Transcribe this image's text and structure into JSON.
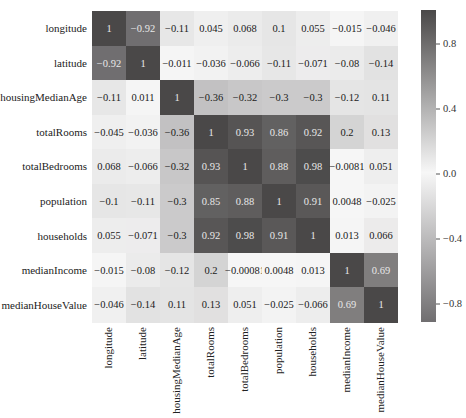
{
  "chart_data": {
    "type": "heatmap",
    "title": "",
    "xlabel": "",
    "ylabel": "",
    "labels": [
      "longitude",
      "latitude",
      "housingMedianAge",
      "totalRooms",
      "totalBedrooms",
      "population",
      "households",
      "medianIncome",
      "medianHouseValue"
    ],
    "x_tick_labels_visible": [
      "longitude",
      "latitude",
      "ingMedianAge",
      "totalRooms",
      "totalBedrooms",
      "population",
      "households",
      "medianIncome",
      "anHouseValue"
    ],
    "matrix": [
      [
        1,
        -0.92,
        -0.11,
        0.045,
        0.068,
        0.1,
        0.055,
        -0.015,
        -0.046
      ],
      [
        -0.92,
        1,
        0.011,
        -0.036,
        -0.066,
        -0.11,
        -0.071,
        -0.08,
        -0.14
      ],
      [
        -0.11,
        0.011,
        1,
        -0.36,
        -0.32,
        -0.3,
        -0.3,
        -0.12,
        0.11
      ],
      [
        0.045,
        -0.036,
        -0.36,
        1,
        0.93,
        0.86,
        0.92,
        0.2,
        0.13
      ],
      [
        0.068,
        -0.066,
        -0.32,
        0.93,
        1,
        0.88,
        0.98,
        -0.0081,
        0.051
      ],
      [
        0.1,
        -0.11,
        -0.3,
        0.86,
        0.88,
        1,
        0.91,
        0.0048,
        -0.025
      ],
      [
        0.055,
        -0.071,
        -0.3,
        0.92,
        0.98,
        0.91,
        1,
        0.013,
        0.066
      ],
      [
        -0.015,
        -0.08,
        -0.12,
        0.2,
        -0.0081,
        0.0048,
        0.013,
        1,
        0.69
      ],
      [
        -0.046,
        -0.14,
        0.11,
        0.13,
        0.051,
        -0.025,
        -0.066,
        0.69,
        1
      ]
    ],
    "annotations": [
      [
        "1",
        "−0.92",
        "−0.11",
        "0.045",
        "0.068",
        "0.1",
        "0.055",
        "−0.015",
        "−0.046"
      ],
      [
        "−0.92",
        "1",
        "−0.011",
        "−0.036",
        "−0.066",
        "−0.11",
        "−0.071",
        "−0.08",
        "−0.14"
      ],
      [
        "−0.11",
        "0.011",
        "1",
        "−0.36",
        "−0.32",
        "−0.3",
        "−0.3",
        "−0.12",
        "0.11"
      ],
      [
        "−0.045",
        "−0.036",
        "−0.36",
        "1",
        "0.93",
        "0.86",
        "0.92",
        "0.2",
        "0.13"
      ],
      [
        "0.068",
        "−0.066",
        "−0.32",
        "0.93",
        "1",
        "0.88",
        "0.98",
        "−0.0081",
        "0.051"
      ],
      [
        "−0.1",
        "−0.11",
        "−0.3",
        "0.85",
        "0.88",
        "1",
        "0.91",
        "0.0048",
        "−0.025"
      ],
      [
        "0.055",
        "−0.071",
        "−0.3",
        "0.92",
        "0.98",
        "0.91",
        "1",
        "0.013",
        "0.066"
      ],
      [
        "−0.015",
        "−0.08",
        "−0.12",
        "0.2",
        "−0.00081",
        "0.0048",
        "0.013",
        "1",
        "0.69"
      ],
      [
        "−0.046",
        "−0.14",
        "0.11",
        "0.13",
        "0.051",
        "−0.025",
        "−0.066",
        "0.69",
        "1"
      ]
    ],
    "colorbar": {
      "ticks": [
        "0.8",
        "0.4",
        "0.0",
        "−0.4",
        "−0.8"
      ],
      "tick_values": [
        0.8,
        0.4,
        0.0,
        -0.4,
        -0.8
      ],
      "vmin": -0.92,
      "vmax": 1.0,
      "colors": {
        "high": "#4a4848",
        "mid": "#f7f7f7",
        "low": "#706e70"
      }
    },
    "grid": false,
    "legend_position": "right"
  }
}
